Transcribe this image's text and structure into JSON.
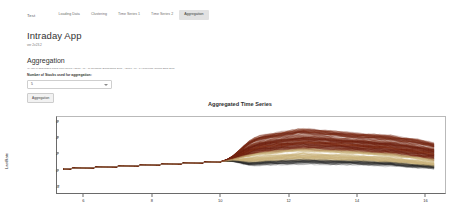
{
  "navbar": {
    "brand": "Test",
    "tabs": [
      {
        "label": "Loading Data",
        "active": false
      },
      {
        "label": "Clustering",
        "active": false
      },
      {
        "label": "Time Series 1",
        "active": false
      },
      {
        "label": "Time Series 2",
        "active": false
      },
      {
        "label": "Aggregation",
        "active": true
      }
    ]
  },
  "page": {
    "title": "Intraday App",
    "subtitle": "ver 2v23.2"
  },
  "aggregation": {
    "section_title": "Aggregation",
    "description": "(1) Info of aggregated actual Time series:  X2013 - 06 - 17 Deutsche Bundesbank EUR ,  X2013 - 06 - 14 Corporate Central Bank EUR",
    "field_label": "Number of Stocks used for aggregation:",
    "select_value": "5",
    "select_options": [
      "1",
      "2",
      "3",
      "4",
      "5"
    ],
    "button_label": "Aggregation"
  },
  "chart_data": {
    "type": "line",
    "title": "Aggregated Time Series",
    "xlabel": "time",
    "ylabel": "LastRate",
    "xticks": [
      6,
      8,
      10,
      12,
      14,
      16
    ],
    "yticks": [
      -2,
      0,
      2,
      4,
      6
    ],
    "xlim": [
      5.2,
      16.6
    ],
    "ylim": [
      -3.0,
      6.6
    ],
    "grid": false,
    "legend": "none",
    "series_count": 420,
    "colors": {
      "bundle_dark": "#6b1f10",
      "bundle_mid": "#8d3a1c",
      "bundle_light": "#c9b27a",
      "bundle_black": "#2a2a2a",
      "baseline": "#9a9a9a",
      "axis": "#6a6a6a"
    },
    "envelope": {
      "x": [
        5.4,
        7.0,
        8.5,
        10.0,
        10.6,
        11.2,
        12.0,
        12.4,
        13.0,
        14.0,
        15.0,
        15.8,
        16.3
      ],
      "upper": [
        0.05,
        0.35,
        0.65,
        0.95,
        3.4,
        4.4,
        5.0,
        5.3,
        5.1,
        4.7,
        4.4,
        3.9,
        3.4
      ],
      "lower": [
        0.05,
        0.35,
        0.65,
        0.95,
        -1.7,
        -2.3,
        -2.6,
        -2.7,
        -2.6,
        -2.3,
        -2.1,
        -1.9,
        -1.8
      ],
      "median": [
        0.05,
        0.35,
        0.65,
        0.95,
        1.4,
        1.8,
        2.1,
        2.2,
        2.1,
        1.9,
        1.6,
        1.2,
        0.9
      ]
    }
  }
}
